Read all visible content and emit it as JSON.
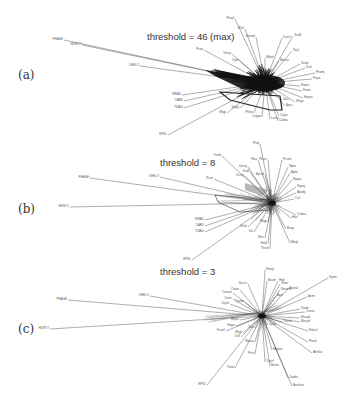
{
  "figure": {
    "panels": [
      {
        "letter": "(a)",
        "title": "threshold = 46 (max)"
      },
      {
        "letter": "(b)",
        "title": "threshold = 8"
      },
      {
        "letter": "(c)",
        "title": "threshold = 3"
      }
    ]
  },
  "panel_a": {
    "center": [
      265,
      83
    ],
    "nodes": [
      {
        "label": "PHAGE",
        "x": 64,
        "y": 40
      },
      {
        "label": "HDNTO",
        "x": 82,
        "y": 45
      },
      {
        "label": "CHELO",
        "x": 140,
        "y": 66
      },
      {
        "label": "Plasd",
        "x": 235,
        "y": 19
      },
      {
        "label": "Pla1",
        "x": 245,
        "y": 29
      },
      {
        "label": "Xenom",
        "x": 256,
        "y": 37
      },
      {
        "label": "Dros1",
        "x": 282,
        "y": 38
      },
      {
        "label": "SnaB",
        "x": 293,
        "y": 36
      },
      {
        "label": "Pcon",
        "x": 204,
        "y": 50
      },
      {
        "label": "Urosy",
        "x": 232,
        "y": 54
      },
      {
        "label": "Orym",
        "x": 240,
        "y": 61
      },
      {
        "label": "Mtlpd",
        "x": 265,
        "y": 58
      },
      {
        "label": "Mouse",
        "x": 279,
        "y": 61
      },
      {
        "label": "Sta1",
        "x": 292,
        "y": 51
      },
      {
        "label": "Sordc",
        "x": 300,
        "y": 64
      },
      {
        "label": "Dsd",
        "x": 305,
        "y": 68
      },
      {
        "label": "Pnomj",
        "x": 315,
        "y": 73
      },
      {
        "label": "Fujan",
        "x": 312,
        "y": 79
      },
      {
        "label": "Hupsc",
        "x": 300,
        "y": 86
      },
      {
        "label": "Fonto",
        "x": 302,
        "y": 91
      },
      {
        "label": "Hupsn",
        "x": 303,
        "y": 98
      },
      {
        "label": "Wegn",
        "x": 295,
        "y": 102
      },
      {
        "label": "Apsc",
        "x": 285,
        "y": 106
      },
      {
        "label": "Sau",
        "x": 282,
        "y": 100
      },
      {
        "label": "WRAX",
        "x": 182,
        "y": 95
      },
      {
        "label": "CARD",
        "x": 184,
        "y": 101
      },
      {
        "label": "TDADt",
        "x": 184,
        "y": 108
      },
      {
        "label": "EPSL",
        "x": 168,
        "y": 135
      },
      {
        "label": "Mtgp",
        "x": 227,
        "y": 113
      },
      {
        "label": "Sropy",
        "x": 240,
        "y": 108
      },
      {
        "label": "Pnkai",
        "x": 254,
        "y": 113
      },
      {
        "label": "Cuppa",
        "x": 262,
        "y": 117
      },
      {
        "label": "Lacto",
        "x": 270,
        "y": 119
      },
      {
        "label": "Colps",
        "x": 279,
        "y": 116
      },
      {
        "label": "Codea",
        "x": 278,
        "y": 121
      }
    ]
  },
  "panel_b": {
    "center": [
      272,
      203
    ],
    "nodes": [
      {
        "label": "PHAGE",
        "x": 90,
        "y": 178
      },
      {
        "label": "HDNTO",
        "x": 70,
        "y": 207
      },
      {
        "label": "CHELO",
        "x": 160,
        "y": 177
      },
      {
        "label": "Trexd",
        "x": 222,
        "y": 156
      },
      {
        "label": "Pleq",
        "x": 260,
        "y": 144
      },
      {
        "label": "Plas",
        "x": 258,
        "y": 160
      },
      {
        "label": "Prcnz",
        "x": 268,
        "y": 160
      },
      {
        "label": "Prcmz",
        "x": 282,
        "y": 160
      },
      {
        "label": "Urosy",
        "x": 248,
        "y": 167
      },
      {
        "label": "Dadl",
        "x": 250,
        "y": 172
      },
      {
        "label": "Dcnig",
        "x": 245,
        "y": 176
      },
      {
        "label": "Bpred",
        "x": 265,
        "y": 175
      },
      {
        "label": "Npen",
        "x": 288,
        "y": 167
      },
      {
        "label": "Aplm",
        "x": 290,
        "y": 173
      },
      {
        "label": "Nypsa",
        "x": 292,
        "y": 180
      },
      {
        "label": "Nrpsq",
        "x": 296,
        "y": 187
      },
      {
        "label": "Apedy",
        "x": 296,
        "y": 193
      },
      {
        "label": "Cuil",
        "x": 294,
        "y": 199
      },
      {
        "label": "Pcon",
        "x": 214,
        "y": 179
      },
      {
        "label": "WRAU",
        "x": 205,
        "y": 220
      },
      {
        "label": "CARD",
        "x": 205,
        "y": 226
      },
      {
        "label": "TDADt",
        "x": 205,
        "y": 232
      },
      {
        "label": "EPSL",
        "x": 192,
        "y": 260
      },
      {
        "label": "Dfulo",
        "x": 248,
        "y": 227
      },
      {
        "label": "Dvl",
        "x": 254,
        "y": 232
      },
      {
        "label": "Mtgp",
        "x": 268,
        "y": 222
      },
      {
        "label": "Mus",
        "x": 265,
        "y": 238
      },
      {
        "label": "Hebi",
        "x": 268,
        "y": 244
      },
      {
        "label": "Thesh",
        "x": 270,
        "y": 249
      },
      {
        "label": "Mwgl",
        "x": 290,
        "y": 243
      },
      {
        "label": "Rvop",
        "x": 286,
        "y": 229
      },
      {
        "label": "Codea",
        "x": 296,
        "y": 215
      },
      {
        "label": "Hacl",
        "x": 291,
        "y": 218
      }
    ]
  },
  "panel_c": {
    "center": [
      262,
      316
    ],
    "nodes": [
      {
        "label": "PHAGE",
        "x": 68,
        "y": 300
      },
      {
        "label": "HDNTO",
        "x": 50,
        "y": 329
      },
      {
        "label": "CHELO",
        "x": 150,
        "y": 296
      },
      {
        "label": "Healp",
        "x": 265,
        "y": 270
      },
      {
        "label": "Saccv",
        "x": 248,
        "y": 284
      },
      {
        "label": "Bsum",
        "x": 267,
        "y": 281
      },
      {
        "label": "Hed",
        "x": 278,
        "y": 281
      },
      {
        "label": "Xbek",
        "x": 280,
        "y": 284
      },
      {
        "label": "Kyom",
        "x": 328,
        "y": 278
      },
      {
        "label": "Neums",
        "x": 280,
        "y": 290
      },
      {
        "label": "Apsiral",
        "x": 288,
        "y": 289
      },
      {
        "label": "Apel",
        "x": 276,
        "y": 296
      },
      {
        "label": "Aemr",
        "x": 307,
        "y": 297
      },
      {
        "label": "Cureen",
        "x": 233,
        "y": 293
      },
      {
        "label": "Coten",
        "x": 240,
        "y": 290
      },
      {
        "label": "Cvmn",
        "x": 233,
        "y": 299
      },
      {
        "label": "Drpel",
        "x": 230,
        "y": 304
      },
      {
        "label": "Cynbe",
        "x": 245,
        "y": 302
      },
      {
        "label": "Srodc",
        "x": 300,
        "y": 309
      },
      {
        "label": "Cnexu",
        "x": 305,
        "y": 312
      },
      {
        "label": "Mosyd",
        "x": 300,
        "y": 318
      },
      {
        "label": "Mocyd",
        "x": 300,
        "y": 322
      },
      {
        "label": "Halsul",
        "x": 308,
        "y": 331
      },
      {
        "label": "Plaxd",
        "x": 308,
        "y": 342
      },
      {
        "label": "Ahrtlux",
        "x": 312,
        "y": 353
      },
      {
        "label": "Mlpsa",
        "x": 240,
        "y": 320
      },
      {
        "label": "Hipps",
        "x": 236,
        "y": 326
      },
      {
        "label": "Fcoo1",
        "x": 226,
        "y": 331
      },
      {
        "label": "Mtgp",
        "x": 243,
        "y": 333
      },
      {
        "label": "Dell",
        "x": 241,
        "y": 337
      },
      {
        "label": "Sixz",
        "x": 255,
        "y": 328
      },
      {
        "label": "Cprpl",
        "x": 268,
        "y": 325
      },
      {
        "label": "Thesd",
        "x": 282,
        "y": 322
      },
      {
        "label": "Wascp",
        "x": 255,
        "y": 342
      },
      {
        "label": "Pcnt",
        "x": 255,
        "y": 354
      },
      {
        "label": "Hbpnd",
        "x": 272,
        "y": 350
      },
      {
        "label": "Tioarf",
        "x": 265,
        "y": 362
      },
      {
        "label": "Bnate",
        "x": 270,
        "y": 366
      },
      {
        "label": "Fasd",
        "x": 235,
        "y": 368
      },
      {
        "label": "EPSL",
        "x": 207,
        "y": 385
      },
      {
        "label": "Cenbx",
        "x": 288,
        "y": 378
      },
      {
        "label": "Arauhas",
        "x": 292,
        "y": 386
      }
    ]
  }
}
